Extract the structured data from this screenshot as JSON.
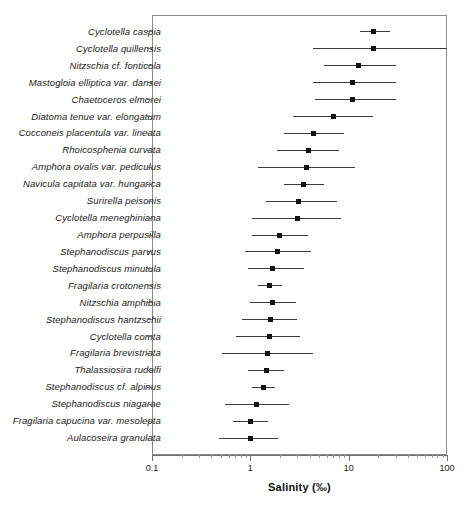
{
  "chart_data": {
    "type": "scatter",
    "title": "",
    "xlabel": "Salinity (‰)",
    "ylabel": "",
    "xscale": "log",
    "xlim": [
      0.1,
      100
    ],
    "xticks": [
      0.1,
      1,
      10,
      100
    ],
    "xtick_labels": [
      "0.1",
      "1",
      "10",
      "100"
    ],
    "grid": false,
    "legend": null,
    "orientation": "horizontal",
    "series_note": "Each row shows a species optimum (point) with its tolerance range (horizontal error bar), on a log salinity axis.",
    "categories": [
      "Cyclotella caspia",
      "Cyclotella quillensis",
      "Nitzschia cf. fonticola",
      "Mastogloia elliptica var. dansei",
      "Chaetoceros elmorei",
      "Diatoma tenue var. elongatum",
      "Cocconeis placentula var. lineata",
      "Rhoicosphenia curvata",
      "Amphora ovalis var. pediculus",
      "Navicula capitata var. hungarica",
      "Surirella peisonis",
      "Cyclotella meneghiniana",
      "Amphora perpusilla",
      "Stephanodiscus parvus",
      "Stephanodiscus minutula",
      "Fragilaria crotonensis",
      "Nitzschia amphibia",
      "Stephanodiscus hantzschii",
      "Cyclotella comta",
      "Fragilaria brevistriata",
      "Thalassiosira rudolfi",
      "Stephanodiscus cf. alpinus",
      "Stephanodiscus niagarae",
      "Fragilaria capucina var. mesolepta",
      "Aulacoseira granulata"
    ],
    "points": [
      {
        "name": "Cyclotella caspia",
        "optimum": 18.0,
        "low": 13.0,
        "high": 26.5
      },
      {
        "name": "Cyclotella quillensis",
        "optimum": 18.0,
        "low": 4.3,
        "high": 100.0
      },
      {
        "name": "Nitzschia cf. fonticola",
        "optimum": 12.5,
        "low": 5.6,
        "high": 30.0
      },
      {
        "name": "Mastogloia elliptica var. dansei",
        "optimum": 11.0,
        "low": 4.3,
        "high": 30.0
      },
      {
        "name": "Chaetoceros elmorei",
        "optimum": 11.0,
        "low": 4.5,
        "high": 30.0
      },
      {
        "name": "Diatoma tenue var. elongatum",
        "optimum": 7.0,
        "low": 2.7,
        "high": 17.5
      },
      {
        "name": "Cocconeis placentula var. lineata",
        "optimum": 4.4,
        "low": 2.2,
        "high": 9.0
      },
      {
        "name": "Rhoicosphenia curvata",
        "optimum": 3.9,
        "low": 1.85,
        "high": 8.0
      },
      {
        "name": "Amphora ovalis var. pediculus",
        "optimum": 3.7,
        "low": 1.2,
        "high": 11.5
      },
      {
        "name": "Navicula capitata var. hungarica",
        "optimum": 3.5,
        "low": 2.2,
        "high": 5.6
      },
      {
        "name": "Surirella peisonis",
        "optimum": 3.1,
        "low": 1.45,
        "high": 7.6
      },
      {
        "name": "Cyclotella meneghiniana",
        "optimum": 3.0,
        "low": 1.05,
        "high": 8.3
      },
      {
        "name": "Amphora perpusilla",
        "optimum": 2.0,
        "low": 1.05,
        "high": 3.9
      },
      {
        "name": "Stephanodiscus parvus",
        "optimum": 1.9,
        "low": 0.88,
        "high": 4.1
      },
      {
        "name": "Stephanodiscus minutula",
        "optimum": 1.7,
        "low": 0.95,
        "high": 3.5
      },
      {
        "name": "Fragilaria crotonensis",
        "optimum": 1.55,
        "low": 1.2,
        "high": 2.1
      },
      {
        "name": "Nitzschia amphibia",
        "optimum": 1.7,
        "low": 1.0,
        "high": 2.9
      },
      {
        "name": "Stephanodiscus hantzschii",
        "optimum": 1.6,
        "low": 0.82,
        "high": 3.0
      },
      {
        "name": "Cyclotella comta",
        "optimum": 1.55,
        "low": 0.72,
        "high": 3.2
      },
      {
        "name": "Fragilaria brevistriata",
        "optimum": 1.5,
        "low": 0.52,
        "high": 4.3
      },
      {
        "name": "Thalassiosira rudolfi",
        "optimum": 1.45,
        "low": 0.95,
        "high": 2.2
      },
      {
        "name": "Stephanodiscus cf. alpinus",
        "optimum": 1.35,
        "low": 1.05,
        "high": 1.8
      },
      {
        "name": "Stephanodiscus niagarae",
        "optimum": 1.15,
        "low": 0.55,
        "high": 2.5
      },
      {
        "name": "Fragilaria capucina var. mesolepta",
        "optimum": 1.0,
        "low": 0.66,
        "high": 1.5
      },
      {
        "name": "Aulacoseira granulata",
        "optimum": 1.0,
        "low": 0.48,
        "high": 1.9
      }
    ]
  }
}
